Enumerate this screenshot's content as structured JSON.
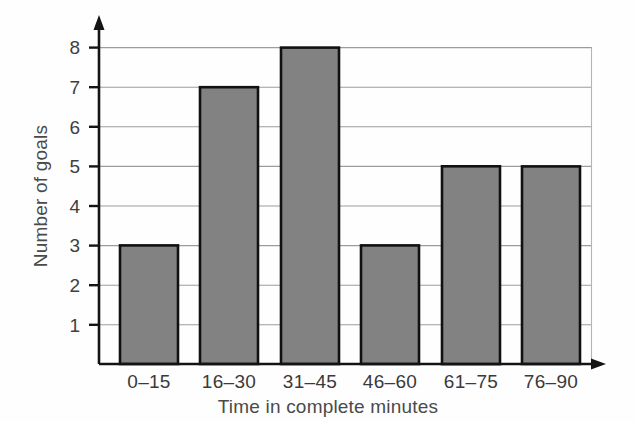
{
  "chart_data": {
    "type": "bar",
    "title": "",
    "subtitle": "",
    "xlabel": "Time in complete minutes",
    "ylabel": "Number of goals",
    "categories": [
      "0–15",
      "16–30",
      "31–45",
      "46–60",
      "61–75",
      "76–90"
    ],
    "values": [
      6,
      3,
      7,
      8,
      3,
      5
    ],
    "ylim": [
      0,
      8
    ],
    "ytick_labels": [
      "1",
      "2",
      "3",
      "4",
      "5",
      "6",
      "7",
      "8"
    ],
    "ytick_values": [
      1,
      2,
      3,
      4,
      5,
      6,
      7,
      8
    ],
    "grid": true,
    "grid_axis": "y",
    "legend": null,
    "legend_position": "none",
    "annotations": [],
    "bar_fill_color": "#828282",
    "bar_edge_color": "#111111",
    "gridline_color": "#9c9c9c",
    "axis_color": "#141414",
    "background_color": "#fefefe",
    "axis_arrows": true
  }
}
